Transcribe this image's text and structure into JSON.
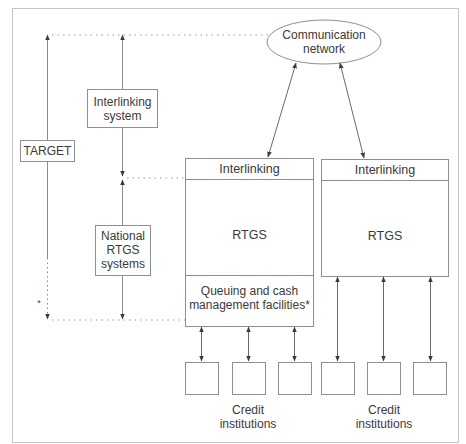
{
  "diagram": {
    "type": "architecture-diagram",
    "colors": {
      "line": "#8a8a8a",
      "box_border": "#8f8f8f",
      "text": "#3a3a3a",
      "background": "#ffffff"
    },
    "nodes": {
      "communication_network": {
        "line1": "Communication",
        "line2": "network"
      },
      "target": {
        "label": "TARGET"
      },
      "interlinking_system": {
        "line1": "Interlinking",
        "line2": "system"
      },
      "national_rtgs": {
        "line1": "National",
        "line2": "RTGS",
        "line3": "systems"
      },
      "left_rtgs_block": {
        "interlinking": "Interlinking",
        "rtgs": "RTGS",
        "queue_line1": "Queuing and cash",
        "queue_line2": "management facilities*"
      },
      "right_rtgs_block": {
        "interlinking": "Interlinking",
        "rtgs": "RTGS"
      },
      "credit_left": {
        "line1": "Credit",
        "line2": "institutions"
      },
      "credit_right": {
        "line1": "Credit",
        "line2": "institutions"
      }
    },
    "footnote_marker": "*",
    "edges": [
      {
        "from": "communication_network",
        "to": "left_rtgs_block.interlinking",
        "style": "solid",
        "arrows": "both"
      },
      {
        "from": "communication_network",
        "to": "right_rtgs_block.interlinking",
        "style": "solid",
        "arrows": "both"
      },
      {
        "from": "left_rtgs_block.queue",
        "to": "credit_left[0..2]",
        "style": "solid",
        "arrows": "both"
      },
      {
        "from": "right_rtgs_block.rtgs",
        "to": "credit_right[0..2]",
        "style": "solid",
        "arrows": "both"
      },
      {
        "from": "target",
        "span": "top-to-bottom",
        "style": "solid+dotted",
        "arrows": "both"
      },
      {
        "from": "interlinking_system",
        "span": "top-to-interlinking",
        "style": "solid",
        "arrows": "both"
      },
      {
        "from": "national_rtgs",
        "span": "interlinking-to-bottom",
        "style": "solid",
        "arrows": "both"
      }
    ]
  }
}
